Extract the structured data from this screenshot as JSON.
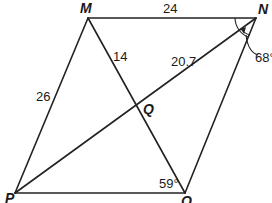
{
  "diagram": {
    "type": "parallelogram-with-diagonals",
    "vertices": {
      "M": {
        "label": "M",
        "x": 88,
        "y": 18
      },
      "N": {
        "label": "N",
        "x": 256,
        "y": 18
      },
      "P": {
        "label": "P",
        "x": 15,
        "y": 193
      },
      "O": {
        "label": "O",
        "x": 185,
        "y": 193
      },
      "Q": {
        "label": "Q",
        "x": 136,
        "y": 106
      }
    },
    "segment_labels": {
      "MN": "24",
      "MP": "26",
      "MQ": "14",
      "NQ": "20.7"
    },
    "angle_labels": {
      "N": "68°",
      "O": "59°"
    }
  }
}
